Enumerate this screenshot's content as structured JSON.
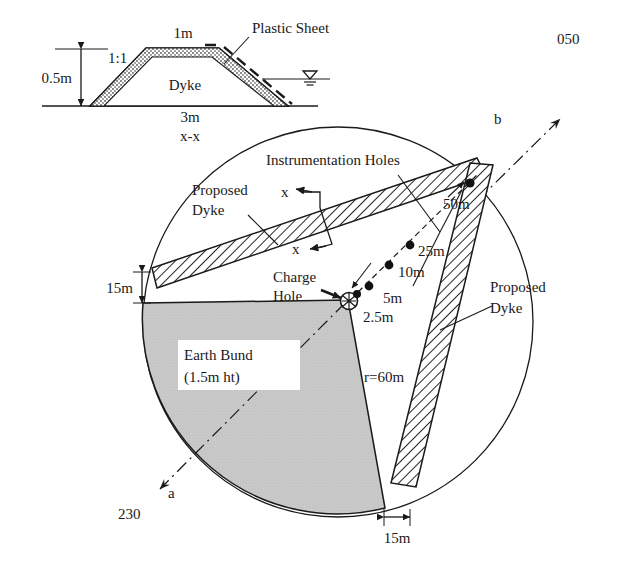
{
  "figure": {
    "type": "engineering-site-plan"
  },
  "cross_section": {
    "title_label": "x-x",
    "crest_width": "1m",
    "base_width": "3m",
    "height": "0.5m",
    "slope_ratio": "1:1",
    "body_label": "Dyke",
    "plastic_sheet_label": "Plastic Sheet",
    "water_table_icon": "water-table-icon"
  },
  "plan": {
    "radius_label": "r=60m",
    "proposed_dyke_label_left": "Proposed\nDyke",
    "proposed_dyke_left_line1": "Proposed",
    "proposed_dyke_left_line2": "Dyke",
    "proposed_dyke_right_line1": "Proposed",
    "proposed_dyke_right_line2": "Dyke",
    "instrumentation_label": "Instrumentation Holes",
    "charge_hole_line1": "Charge",
    "charge_hole_line2": "Hole",
    "earth_bund_line1": "Earth Bund",
    "earth_bund_line2": "(1.5m ht)",
    "section_marker_top": "x",
    "section_marker_bottom": "x",
    "offset_left": "15m",
    "offset_bottom": "15m",
    "bearing_a_label": "a",
    "bearing_a_value": "230",
    "bearing_b_label": "b",
    "bearing_b_value": "050"
  },
  "instrumentation_holes": [
    {
      "label": "2.5m",
      "distance_m": 2.5
    },
    {
      "label": "5m",
      "distance_m": 5
    },
    {
      "label": "10m",
      "distance_m": 10
    },
    {
      "label": "25m",
      "distance_m": 25
    },
    {
      "label": "50m",
      "distance_m": 50
    }
  ],
  "colors": {
    "line": "#1a1a1a",
    "bund_fill": "#c9c9c9",
    "dyke_fill": "#ffffff",
    "section_fill": "#8a8a8a",
    "background": "#ffffff"
  }
}
